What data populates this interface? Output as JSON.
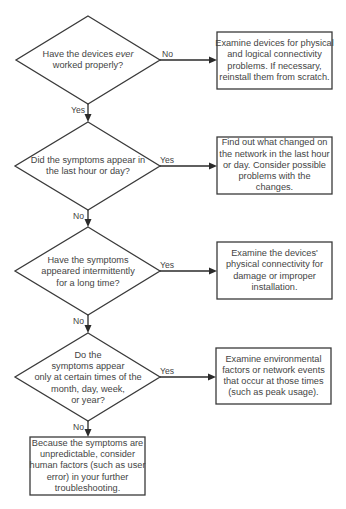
{
  "diagram": {
    "type": "flowchart",
    "colors": {
      "stroke": "#3a3a3a",
      "text": "#444444",
      "background": "#ffffff"
    },
    "decisions": [
      {
        "id": "d1",
        "lines": [
          "Have the devices ",
          "ever",
          " worked properly?"
        ],
        "line1_pre": "Have the devices ",
        "line1_italic": "ever",
        "line2": "worked properly?"
      },
      {
        "id": "d2",
        "lines": [
          "Did the symptoms appear in",
          "the last hour or day?"
        ]
      },
      {
        "id": "d3",
        "lines": [
          "Have the symptoms",
          "appeared intermittently",
          "for a long time?"
        ]
      },
      {
        "id": "d4",
        "lines": [
          "Do the",
          "symptoms appear",
          "only at certain times of the",
          "month, day, week,",
          "or year?"
        ]
      }
    ],
    "actions": [
      {
        "id": "a1",
        "lines": [
          "Examine devices for physical",
          "and logical connectivity",
          "problems.  If necessary,",
          "reinstall them from scratch."
        ]
      },
      {
        "id": "a2",
        "lines": [
          "Find out what changed on",
          "the network in the last hour",
          "or day.  Consider possible",
          "problems with the",
          "changes."
        ]
      },
      {
        "id": "a3",
        "lines": [
          "Examine the devices'",
          "physical connectivity for",
          "damage or improper",
          "installation."
        ]
      },
      {
        "id": "a4",
        "lines": [
          "Examine environmental",
          "factors or network events",
          "that occur at those times",
          "(such as peak usage)."
        ]
      },
      {
        "id": "a5",
        "lines": [
          "Because the symptoms are",
          "unpredictable, consider",
          "human factors (such as user",
          "error) in your further",
          "troubleshooting."
        ]
      }
    ],
    "edges": [
      {
        "from": "d1",
        "to": "a1",
        "label": "No"
      },
      {
        "from": "d1",
        "to": "d2",
        "label": "Yes"
      },
      {
        "from": "d2",
        "to": "a2",
        "label": "Yes"
      },
      {
        "from": "d2",
        "to": "d3",
        "label": "No"
      },
      {
        "from": "d3",
        "to": "a3",
        "label": "Yes"
      },
      {
        "from": "d3",
        "to": "d4",
        "label": "No"
      },
      {
        "from": "d4",
        "to": "a4",
        "label": "Yes"
      },
      {
        "from": "d4",
        "to": "a5",
        "label": "No"
      }
    ]
  }
}
